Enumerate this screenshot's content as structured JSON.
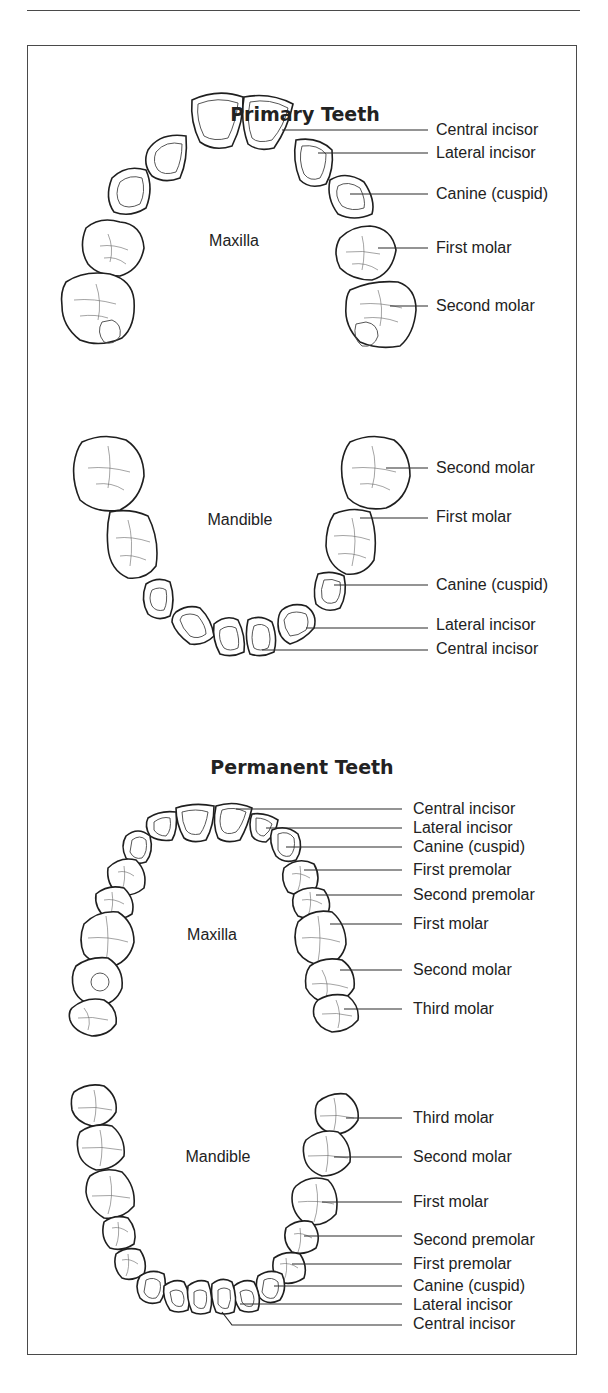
{
  "sections": [
    {
      "title": "Primary Teeth",
      "maxilla": {
        "label": "Maxilla",
        "tooth_labels": [
          "Central incisor",
          "Lateral incisor",
          "Canine (cuspid)",
          "First molar",
          "Second molar"
        ]
      },
      "mandible": {
        "label": "Mandible",
        "tooth_labels": [
          "Second molar",
          "First molar",
          "Canine (cuspid)",
          "Lateral incisor",
          "Central incisor"
        ]
      }
    },
    {
      "title": "Permanent Teeth",
      "maxilla": {
        "label": "Maxilla",
        "tooth_labels": [
          "Central incisor",
          "Lateral incisor",
          "Canine (cuspid)",
          "First premolar",
          "Second premolar",
          "First molar",
          "Second molar",
          "Third molar"
        ]
      },
      "mandible": {
        "label": "Mandible",
        "tooth_labels": [
          "Third molar",
          "Second molar",
          "First molar",
          "Second premolar",
          "First premolar",
          "Canine (cuspid)",
          "Lateral incisor",
          "Central incisor"
        ]
      }
    }
  ],
  "colors": {
    "line": "#1f1f1f",
    "frame": "#4a4a4a",
    "background": "#ffffff"
  }
}
